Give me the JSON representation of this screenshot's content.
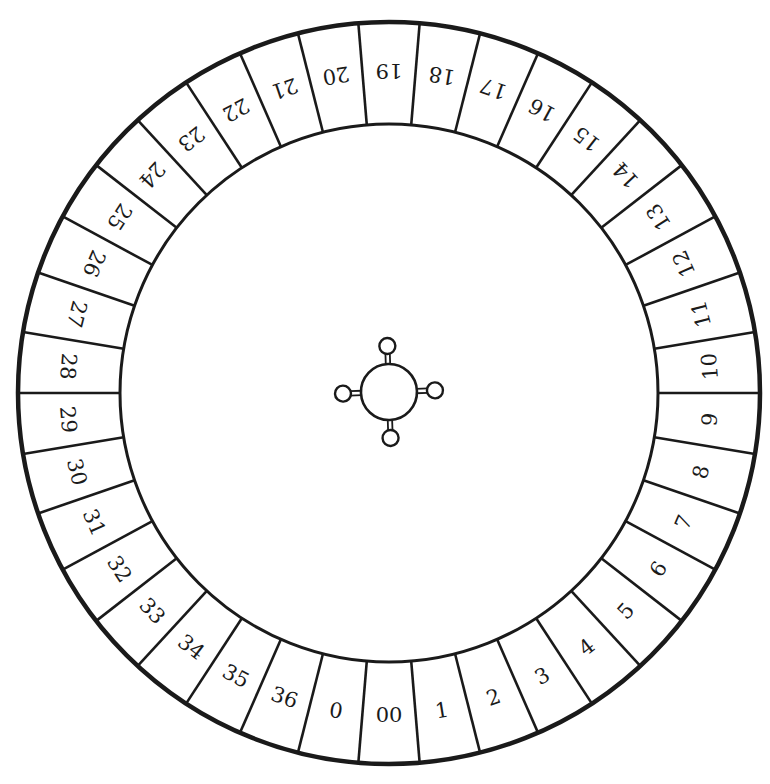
{
  "diagram": {
    "type": "roulette-wheel",
    "slot_count": 38,
    "slots_order_from_bottom_counterclockwise": [
      "00",
      "1",
      "2",
      "3",
      "4",
      "5",
      "6",
      "7",
      "8",
      "9",
      "10",
      "11",
      "12",
      "13",
      "14",
      "15",
      "16",
      "17",
      "18",
      "19",
      "20",
      "21",
      "22",
      "23",
      "24",
      "25",
      "26",
      "27",
      "28",
      "29",
      "30",
      "31",
      "32",
      "33",
      "34",
      "35",
      "36",
      "0"
    ],
    "geometry": {
      "center": [
        389,
        393
      ],
      "outer_radius": 371,
      "inner_radius": 269,
      "label_radius": 322,
      "hub_radius": 28,
      "knob_radius": 8,
      "knob_distance": 46,
      "hub_rotation_deg": -2
    },
    "hub": {
      "label": "spindle",
      "knobs": 4
    },
    "colors": {
      "stroke": "#1a1a1a",
      "background": "#ffffff",
      "slot_fill": "#ffffff"
    }
  }
}
